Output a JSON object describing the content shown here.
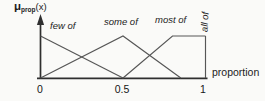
{
  "figure": {
    "y_axis_label": {
      "mu": "μ",
      "sub": "prop",
      "arg": "(x)"
    },
    "x_axis_title": "proportion"
  },
  "chart_data": {
    "type": "line",
    "xlabel": "proportion",
    "ylabel": "μprop(x)",
    "xlim": [
      0,
      1.05
    ],
    "ylim": [
      0,
      1
    ],
    "x_ticks": [
      0,
      0.5,
      1
    ],
    "x_tick_labels": [
      "0",
      "0.5",
      "1"
    ],
    "grid": false,
    "legend_position": "inline-labels-above-curves",
    "series": [
      {
        "name": "few of",
        "points": [
          [
            0,
            1
          ],
          [
            0.5,
            0
          ]
        ]
      },
      {
        "name": "some of",
        "points": [
          [
            0,
            0
          ],
          [
            0.5,
            1
          ],
          [
            0.85,
            0
          ]
        ]
      },
      {
        "name": "most of",
        "points": [
          [
            0.5,
            0
          ],
          [
            0.8,
            1
          ],
          [
            1,
            1
          ]
        ]
      },
      {
        "name": "all of",
        "points": [
          [
            1,
            0
          ],
          [
            1,
            1
          ]
        ]
      }
    ]
  },
  "colors": {
    "background": "#fafaf8",
    "axis": "#2f2f2f",
    "line": "#565656",
    "text": "#1c1c1c"
  }
}
